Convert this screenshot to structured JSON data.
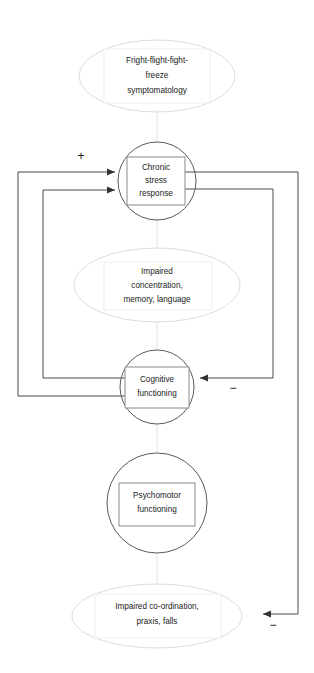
{
  "diagram": {
    "type": "causal-loop-flow-diagram",
    "nodes": [
      {
        "id": "fright-flight-fight-freeze",
        "shape": "ellipse-with-box",
        "lines": [
          "Fright-flight-fight-",
          "freeze",
          "symptomatology"
        ]
      },
      {
        "id": "chronic-stress-response",
        "shape": "circle-with-box",
        "lines": [
          "Chronic",
          "stress",
          "response"
        ]
      },
      {
        "id": "impaired-concentration",
        "shape": "ellipse-with-box",
        "lines": [
          "Impaired",
          "concentration,",
          "memory, language"
        ]
      },
      {
        "id": "cognitive-functioning",
        "shape": "circle-with-box",
        "lines": [
          "Cognitive",
          "functioning"
        ]
      },
      {
        "id": "psychomotor-functioning",
        "shape": "circle-with-box",
        "lines": [
          "Psychomotor",
          "functioning"
        ]
      },
      {
        "id": "impaired-coordination",
        "shape": "ellipse-with-box",
        "lines": [
          "Impaired co-ordination,",
          "praxis, falls"
        ]
      }
    ],
    "signs": [
      {
        "id": "plus-stress-input",
        "label": "+"
      },
      {
        "id": "minus-cognitive-input",
        "label": "−"
      },
      {
        "id": "minus-coordination-input",
        "label": "−"
      }
    ],
    "colors": {
      "ellipse_stroke": "#dcdcdc",
      "circle_stroke": "#5a5a5a",
      "box_stroke": "#8a8a8a",
      "line_stroke": "#4a4a4a",
      "text": "#1a1a1a",
      "background": "#ffffff"
    }
  }
}
